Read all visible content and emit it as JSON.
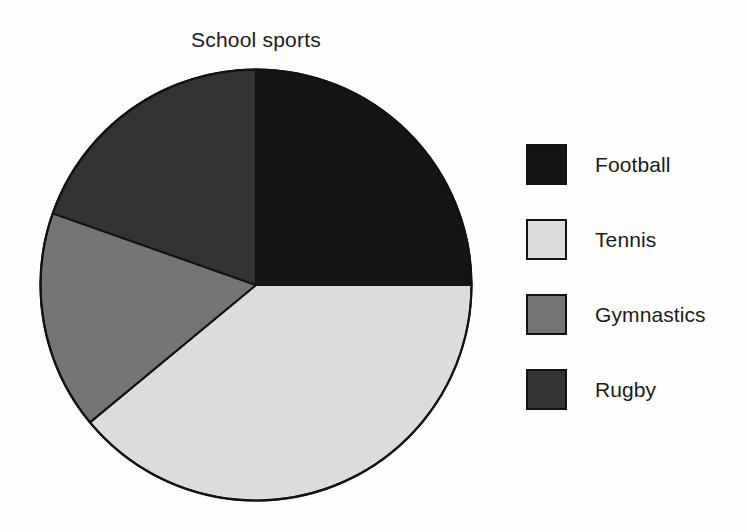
{
  "chart_data": {
    "type": "pie",
    "title": "School sports",
    "xlabel": "",
    "ylabel": "",
    "legend_position": "right",
    "grid": false,
    "start_angle_deg_from_top": 0,
    "direction": "clockwise",
    "categories": [
      "Football",
      "Tennis",
      "Gymnastics",
      "Rugby"
    ],
    "values": [
      25,
      39,
      16.4,
      19.6
    ],
    "units": "percent",
    "slices": [
      {
        "label": "Football",
        "value": 25,
        "percent": 25,
        "angle_start_deg": 0,
        "angle_end_deg": 90,
        "color": "#151515"
      },
      {
        "label": "Tennis",
        "value": 39,
        "percent": 39,
        "angle_start_deg": 90,
        "angle_end_deg": 230.4,
        "color": "#dcdcdc"
      },
      {
        "label": "Gymnastics",
        "value": 16.4,
        "percent": 16.4,
        "angle_start_deg": 230.4,
        "angle_end_deg": 289.4,
        "color": "#757575"
      },
      {
        "label": "Rugby",
        "value": 19.6,
        "percent": 19.6,
        "angle_start_deg": 289.4,
        "angle_end_deg": 360,
        "color": "#333333"
      }
    ]
  },
  "legend": {
    "items": [
      {
        "label": "Football",
        "color": "#151515"
      },
      {
        "label": "Tennis",
        "color": "#dcdcdc"
      },
      {
        "label": "Gymnastics",
        "color": "#757575"
      },
      {
        "label": "Rugby",
        "color": "#333333"
      }
    ]
  },
  "style": {
    "background": "#fdfdfc",
    "outline": "#121212",
    "text": "#1b1b1b"
  }
}
